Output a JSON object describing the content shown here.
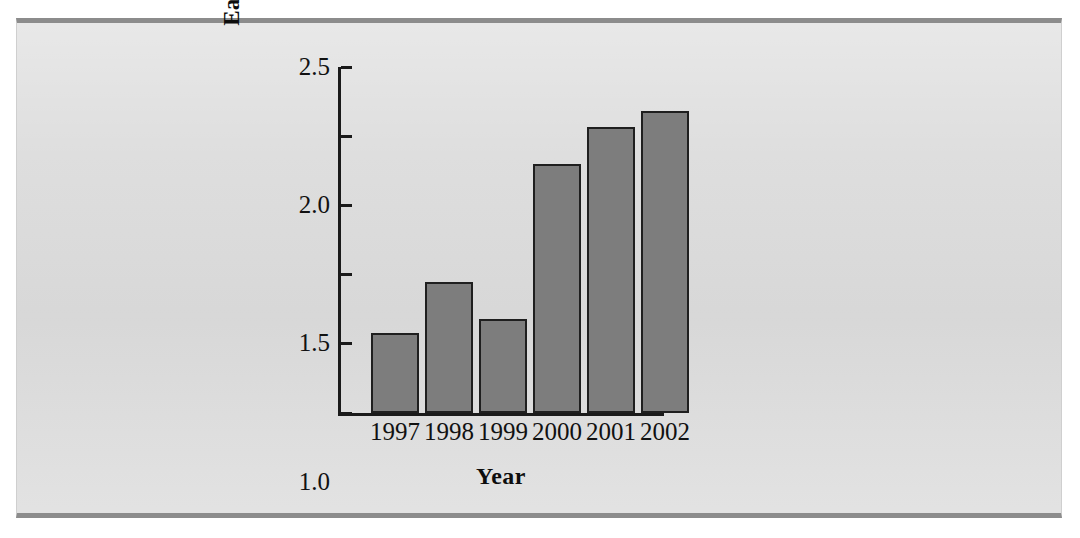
{
  "figure": {
    "background_color": "#dcdcdc",
    "page_color": "#ffffff",
    "rule_color": "#8c8c8c",
    "bar_fill_color": "#7d7d7d",
    "bar_edge_color": "#1f1f1f",
    "axis_color": "#1a1a1a"
  },
  "chart_data": {
    "type": "bar",
    "title": "",
    "xlabel": "Year",
    "ylabel": "Earnings ($ billions)",
    "categories": [
      "1997",
      "1998",
      "1999",
      "2000",
      "2001",
      "2002"
    ],
    "values": [
      0.58,
      0.95,
      0.68,
      1.8,
      2.07,
      2.18
    ],
    "series": [
      {
        "name": "Earnings",
        "values": [
          0.58,
          0.95,
          0.68,
          1.8,
          2.07,
          2.18
        ]
      }
    ],
    "ylim": [
      0,
      2.5
    ],
    "ytick_values": [
      0,
      0.5,
      1.0,
      1.5,
      2.0,
      2.5
    ],
    "ytick_labels": [
      "0",
      "0.5",
      "1.0",
      "1.5",
      "2.0",
      "2.5"
    ],
    "xtick_labels": [
      "1997",
      "1998",
      "1999",
      "2000",
      "2001",
      "2002"
    ],
    "grid": false,
    "legend": null,
    "legend_position": "none",
    "annotations": []
  }
}
